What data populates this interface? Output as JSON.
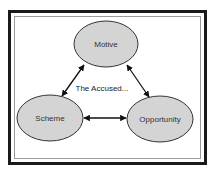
{
  "diagram": {
    "center_label": "The Accused...",
    "nodes": [
      {
        "id": "motive",
        "label": "Motive"
      },
      {
        "id": "scheme",
        "label": "Scheme"
      },
      {
        "id": "opportunity",
        "label": "Opportunity"
      }
    ],
    "edges": [
      {
        "from": "motive",
        "to": "scheme",
        "bidirectional": true
      },
      {
        "from": "motive",
        "to": "opportunity",
        "bidirectional": true
      },
      {
        "from": "scheme",
        "to": "opportunity",
        "bidirectional": true
      }
    ],
    "colors": {
      "node_fill": "#d4d4d4",
      "node_stroke": "#333333",
      "arrow": "#111111",
      "frame": "#1a1a1a",
      "inner_frame": "#9a9a9a"
    }
  }
}
